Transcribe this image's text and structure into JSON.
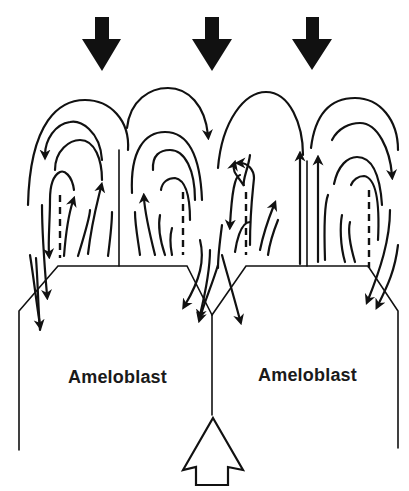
{
  "diagram": {
    "type": "field-line schematic",
    "labels": {
      "left_cell": "Ameloblast",
      "right_cell": "Ameloblast"
    },
    "arrows": {
      "top_filled_count": 3,
      "top_filled_direction": "down",
      "bottom_outline_count": 1,
      "bottom_outline_direction": "up"
    },
    "colors": {
      "ink": "#111111",
      "background": "#ffffff"
    }
  }
}
